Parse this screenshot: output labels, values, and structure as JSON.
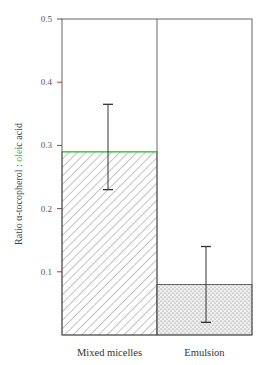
{
  "chart_data": {
    "type": "bar",
    "title": "",
    "xlabel": "",
    "ylabel": "Ratio α-tocopherol : oleic acid",
    "ylabel_parts": {
      "prefix": "Ratio α-tocopherol : ",
      "highlight": "ole",
      "suffix": "ic acid"
    },
    "categories": [
      "Mixed micelles",
      "Emulsion"
    ],
    "values": [
      0.29,
      0.08
    ],
    "error_bars": [
      {
        "category": "Mixed micelles",
        "low": 0.23,
        "high": 0.365
      },
      {
        "category": "Emulsion",
        "low": 0.02,
        "high": 0.14
      }
    ],
    "fills": [
      "diagonal-hatch",
      "stipple"
    ],
    "ylim": [
      0,
      0.5
    ],
    "yticks": [
      "0.1",
      "0.2",
      "0.3",
      "0.4",
      "0.5"
    ],
    "grid": false,
    "legend": null
  },
  "colors": {
    "axis": "#555555",
    "highlight_line": "#33dd33",
    "tick_0_4": "#cc3333",
    "ylabel_highlight": "#33bb33"
  }
}
